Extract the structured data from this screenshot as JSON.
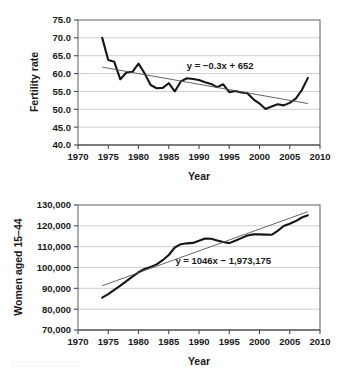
{
  "chart_data": [
    {
      "id": "fertility",
      "type": "line",
      "title": "",
      "xlabel": "Year",
      "ylabel": "Fertility rate",
      "xlim": [
        1970,
        2010
      ],
      "ylim": [
        40.0,
        75.0
      ],
      "xticks": [
        1970,
        1975,
        1980,
        1985,
        1990,
        1995,
        2000,
        2005,
        2010
      ],
      "xticklabels": [
        "1970",
        "1975",
        "1980",
        "1985",
        "1990",
        "1995",
        "2000",
        "2005",
        "2010"
      ],
      "yticks": [
        40.0,
        45.0,
        50.0,
        55.0,
        60.0,
        65.0,
        70.0,
        75.0
      ],
      "yticklabels": [
        "40.0",
        "45.0",
        "50.0",
        "55.0",
        "60.0",
        "65.0",
        "70.0",
        "75.0"
      ],
      "grid": "horizontal",
      "legend": "none",
      "annotations": [
        {
          "name": "trendline-equation",
          "text": "y = −0.3x + 652",
          "x": 1993.5,
          "y": 61.2
        }
      ],
      "series": [
        {
          "name": "Fertility rate",
          "x": [
            1974,
            1975,
            1976,
            1977,
            1978,
            1979,
            1980,
            1981,
            1982,
            1983,
            1984,
            1985,
            1986,
            1987,
            1988,
            1989,
            1990,
            1991,
            1992,
            1993,
            1994,
            1995,
            1996,
            1997,
            1998,
            1999,
            2000,
            2001,
            2002,
            2003,
            2004,
            2005,
            2006,
            2007,
            2008
          ],
          "values": [
            70.0,
            63.8,
            63.3,
            58.4,
            60.3,
            60.5,
            62.8,
            60.1,
            56.8,
            55.9,
            56.0,
            57.3,
            55.0,
            57.8,
            58.7,
            58.5,
            58.2,
            57.6,
            57.1,
            56.2,
            57.0,
            54.8,
            55.1,
            54.7,
            54.5,
            52.8,
            51.6,
            50.1,
            50.8,
            51.4,
            51.1,
            51.8,
            53.0,
            55.4,
            58.8
          ]
        }
      ],
      "trendline": {
        "name": "Linear fit",
        "equation": "y = −0.3x + 652",
        "slope": -0.3,
        "intercept": 652,
        "x": [
          1974,
          2008
        ],
        "values": [
          61.8,
          51.6
        ]
      }
    },
    {
      "id": "women-15-44",
      "type": "line",
      "title": "",
      "xlabel": "Year",
      "ylabel": "Women aged 15–44",
      "xlim": [
        1970,
        2010
      ],
      "ylim": [
        70000,
        130000
      ],
      "xticks": [
        1970,
        1975,
        1980,
        1985,
        1990,
        1995,
        2000,
        2005,
        2010
      ],
      "xticklabels": [
        "1970",
        "1975",
        "1980",
        "1985",
        "1990",
        "1995",
        "2000",
        "2005",
        "2010"
      ],
      "yticks": [
        70000,
        80000,
        90000,
        100000,
        110000,
        120000,
        130000
      ],
      "yticklabels": [
        "70,000",
        "80,000",
        "90,000",
        "100,000",
        "110,000",
        "120,000",
        "130,000"
      ],
      "grid": "horizontal",
      "legend": "none",
      "annotations": [
        {
          "name": "trendline-equation",
          "text": "y = 1046x − 1,973,175",
          "x": 1994.0,
          "y": 101500
        }
      ],
      "series": [
        {
          "name": "Women aged 15-44",
          "x": [
            1974,
            1975,
            1976,
            1977,
            1978,
            1979,
            1980,
            1981,
            1982,
            1983,
            1984,
            1985,
            1986,
            1987,
            1988,
            1989,
            1990,
            1991,
            1992,
            1993,
            1994,
            1995,
            1996,
            1997,
            1998,
            1999,
            2000,
            2001,
            2002,
            2003,
            2004,
            2005,
            2006,
            2007,
            2008
          ],
          "values": [
            85500,
            87200,
            89300,
            91300,
            93500,
            95600,
            97700,
            99300,
            100300,
            101500,
            103500,
            106000,
            109600,
            111200,
            111600,
            111800,
            112800,
            113900,
            113800,
            113000,
            112200,
            111700,
            112800,
            114100,
            115400,
            115900,
            115900,
            115800,
            115700,
            117600,
            119900,
            121000,
            122300,
            124000,
            125100
          ]
        }
      ],
      "trendline": {
        "name": "Linear fit",
        "equation": "y = 1046x − 1,973,175",
        "slope": 1046,
        "intercept": -1973175,
        "x": [
          1974,
          2008
        ],
        "values": [
          91229,
          126793
        ]
      }
    }
  ]
}
